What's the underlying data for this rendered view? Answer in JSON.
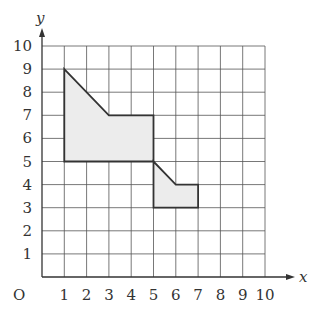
{
  "chart_data": {
    "type": "diagram",
    "title": "",
    "xlabel": "x",
    "ylabel": "y",
    "origin_label": "O",
    "xlim": [
      0,
      10
    ],
    "ylim": [
      0,
      10
    ],
    "grid": true,
    "x_ticks": [
      "1",
      "2",
      "3",
      "4",
      "5",
      "6",
      "7",
      "8",
      "9",
      "10"
    ],
    "y_ticks": [
      "1",
      "2",
      "3",
      "4",
      "5",
      "6",
      "7",
      "8",
      "9",
      "10"
    ],
    "shapes": [
      {
        "name": "shape-A",
        "vertices": [
          [
            1,
            9
          ],
          [
            3,
            7
          ],
          [
            5,
            7
          ],
          [
            5,
            5
          ],
          [
            1,
            5
          ]
        ],
        "fill": "#ececec"
      },
      {
        "name": "shape-B",
        "vertices": [
          [
            5,
            5
          ],
          [
            6,
            4
          ],
          [
            7,
            4
          ],
          [
            7,
            3
          ],
          [
            5,
            3
          ]
        ],
        "fill": "#ececec"
      }
    ],
    "colors": {
      "grid": "#555555",
      "outline": "#333333",
      "fill": "#ececec"
    }
  },
  "labels": {
    "x_axis": "x",
    "y_axis": "y",
    "origin": "O",
    "x_ticks": [
      "1",
      "2",
      "3",
      "4",
      "5",
      "6",
      "7",
      "8",
      "9",
      "10"
    ],
    "y_ticks": [
      "1",
      "2",
      "3",
      "4",
      "5",
      "6",
      "7",
      "8",
      "9",
      "10"
    ]
  }
}
